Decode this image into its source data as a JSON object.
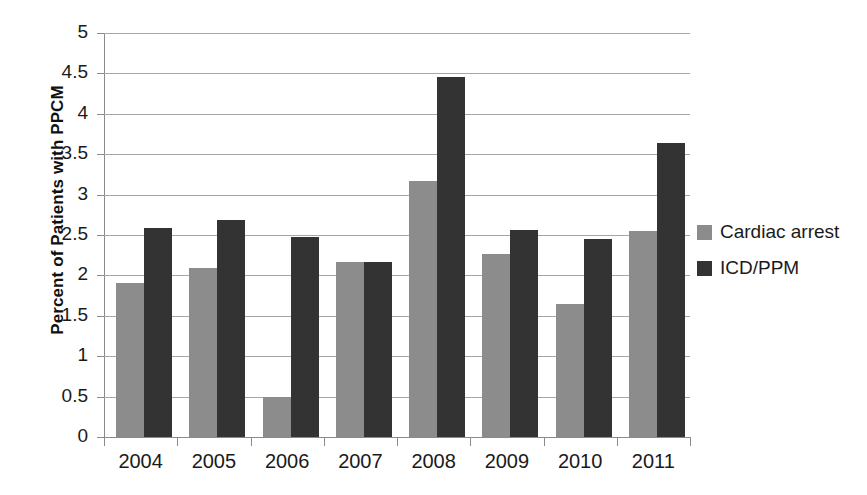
{
  "chart_data": {
    "type": "bar",
    "title": "",
    "xlabel": "",
    "ylabel": "Percent of Patients with PPCM",
    "categories": [
      "2004",
      "2005",
      "2006",
      "2007",
      "2008",
      "2009",
      "2010",
      "2011"
    ],
    "series": [
      {
        "name": "Cardiac arrest",
        "color": "#8c8c8c",
        "values": [
          1.9,
          2.09,
          0.49,
          2.17,
          3.17,
          2.27,
          1.65,
          2.55
        ]
      },
      {
        "name": "ICD/PPM",
        "color": "#333333",
        "values": [
          2.59,
          2.68,
          2.47,
          2.17,
          4.46,
          2.56,
          2.45,
          3.64
        ]
      }
    ],
    "ylim": [
      0,
      5
    ],
    "y_ticks": [
      "0",
      "0.5",
      "1",
      "1.5",
      "2",
      "2.5",
      "3",
      "3.5",
      "4",
      "4.5",
      "5"
    ],
    "y_tick_values": [
      0,
      0.5,
      1,
      1.5,
      2,
      2.5,
      3,
      3.5,
      4,
      4.5,
      5
    ],
    "grid": true,
    "legend_position": "right"
  },
  "legend": {
    "items": [
      {
        "label": "Cardiac arrest",
        "color": "#8c8c8c"
      },
      {
        "label": "ICD/PPM",
        "color": "#333333"
      }
    ]
  }
}
